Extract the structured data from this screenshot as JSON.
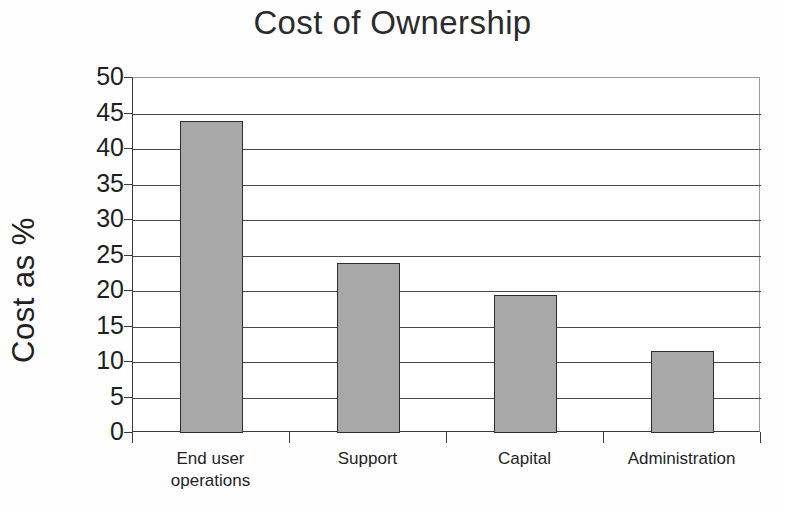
{
  "chart_data": {
    "type": "bar",
    "title": "Cost of Ownership",
    "xlabel": "",
    "ylabel": "Cost as %",
    "categories": [
      "End user operations",
      "Support",
      "Capital",
      "Administration"
    ],
    "values": [
      44,
      24,
      19.5,
      11.5
    ],
    "ylim": [
      0,
      50
    ],
    "ytick_step": 5,
    "yticks": [
      50,
      45,
      40,
      35,
      30,
      25,
      20,
      15,
      10,
      5,
      0
    ],
    "grid": "horizontal",
    "legend": "none",
    "bar_color": "#a8a8a8",
    "bar_border_color": "#2e2e2e",
    "gridline_color": "#4a4a4a",
    "axis_color": "#3a3a3a",
    "background_color": "#ffffff"
  },
  "category_lines": [
    [
      "End user",
      "operations"
    ],
    [
      "Support",
      ""
    ],
    [
      "Capital",
      ""
    ],
    [
      "Administration",
      ""
    ]
  ]
}
